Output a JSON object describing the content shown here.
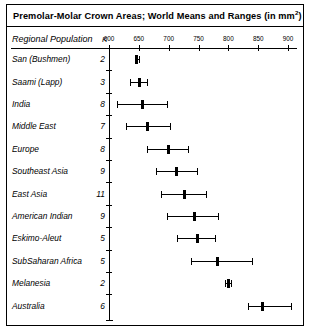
{
  "figure": {
    "title": "Premolar-Molar Crown Areas; World Means and Ranges (in mm",
    "title_superscript": "2",
    "title_suffix": ")",
    "column_headers": {
      "population": "Regional Population",
      "k": "K"
    }
  },
  "chart_data": {
    "type": "scatter",
    "xlabel": "",
    "ylabel": "Regional Population",
    "xlim": [
      600,
      910
    ],
    "tick_values": [
      600,
      650,
      700,
      750,
      800,
      850,
      900
    ],
    "tick_labels": [
      "600",
      "650",
      "700",
      "750",
      "800",
      "850",
      "900"
    ],
    "grid": false,
    "legend": false,
    "categories": [
      "San (Bushmen)",
      "Saami (Lapp)",
      "India",
      "Middle East",
      "Europe",
      "Southeast Asia",
      "East Asia",
      "American Indian",
      "Eskimo-Aleut",
      "SubSaharan Africa",
      "Melanesia",
      "Australia"
    ],
    "k_values": [
      2,
      3,
      8,
      7,
      8,
      9,
      11,
      9,
      5,
      5,
      2,
      6
    ],
    "series": [
      {
        "name": "mean",
        "values": [
          646,
          650,
          656,
          664,
          699,
          712,
          726,
          742,
          747,
          781,
          800,
          857
        ]
      },
      {
        "name": "range_low",
        "values": [
          643,
          636,
          613,
          628,
          664,
          679,
          687,
          697,
          714,
          738,
          795,
          833
        ]
      },
      {
        "name": "range_high",
        "values": [
          650,
          663,
          697,
          702,
          733,
          748,
          762,
          782,
          777,
          840,
          805,
          905
        ]
      }
    ]
  }
}
